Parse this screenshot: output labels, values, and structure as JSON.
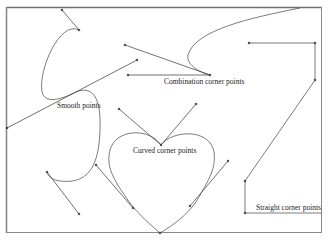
{
  "diagram": {
    "type": "bezier-anchor-point-types",
    "colors": {
      "background": "#ffffff",
      "frame": "#7a7a7a",
      "stroke": "#444444",
      "handle": "#333333",
      "text": "#222222"
    },
    "labels": {
      "smooth": "Smooth points",
      "combination": "Combination corner points",
      "curved": "Curved corner points",
      "straight": "Straight corner points"
    }
  }
}
